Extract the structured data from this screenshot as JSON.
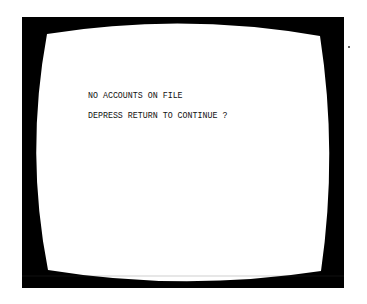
{
  "terminal": {
    "lines": [
      "NO ACCOUNTS ON FILE",
      "DEPRESS RETURN TO CONTINUE ?"
    ]
  },
  "colors": {
    "bezel": "#000000",
    "screen": "#ffffff",
    "text": "#111111"
  }
}
